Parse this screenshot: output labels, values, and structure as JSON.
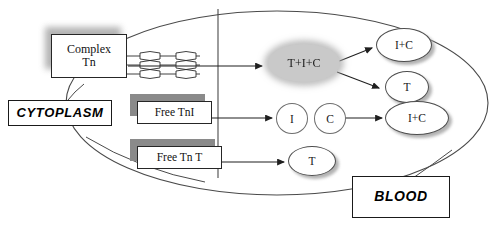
{
  "diagram": {
    "compartments": {
      "cytoplasm": "CYTOPLASM",
      "blood": "BLOOD"
    },
    "cell_boundary": {
      "shape": "ellipse",
      "label": "cell-membrane"
    },
    "membrane_line": {
      "orientation": "vertical",
      "label": "membrane-boundary"
    },
    "cytoplasm_nodes": [
      {
        "id": "complex-tn",
        "label": "Complex\nTn",
        "shape": "rect",
        "shadow": "soft"
      },
      {
        "id": "free-tni",
        "label": "Free TnI",
        "shape": "rect",
        "shadow": "dark"
      },
      {
        "id": "free-tnt",
        "label": "Free Tn T",
        "shape": "rect",
        "shadow": "dark"
      }
    ],
    "myofilament": {
      "id": "myofilament",
      "label": "sarcomere-filament-icon",
      "rows": 3
    },
    "blood_nodes": [
      {
        "id": "t-i-c",
        "label": "T+I+C",
        "shape": "ellipse",
        "fill": "#c9c9c9"
      },
      {
        "id": "i-c-upper",
        "label": "I+C",
        "shape": "ellipse",
        "fill": "#ffffff"
      },
      {
        "id": "t-upper",
        "label": "T",
        "shape": "ellipse",
        "fill": "#ffffff"
      },
      {
        "id": "i-free",
        "label": "I",
        "shape": "ellipse",
        "fill": "#ffffff"
      },
      {
        "id": "c-free",
        "label": "C",
        "shape": "ellipse",
        "fill": "#ffffff"
      },
      {
        "id": "i-c-lower",
        "label": "I+C",
        "shape": "ellipse",
        "fill": "#ffffff"
      },
      {
        "id": "t-lower",
        "label": "T",
        "shape": "ellipse",
        "fill": "#ffffff"
      }
    ],
    "arrows": [
      {
        "id": "arrow-complex-to-tic",
        "from": "complex-tn",
        "to": "t-i-c"
      },
      {
        "id": "arrow-tni-to-i",
        "from": "free-tni",
        "to": "i-free"
      },
      {
        "id": "arrow-tnt-to-t",
        "from": "free-tnt",
        "to": "t-lower"
      },
      {
        "id": "arrow-tic-to-ic",
        "from": "t-i-c",
        "to": "i-c-upper"
      },
      {
        "id": "arrow-tic-to-t",
        "from": "t-i-c",
        "to": "t-upper"
      },
      {
        "id": "arrow-c-to-ic",
        "from": "c-free",
        "to": "i-c-lower"
      }
    ],
    "colors": {
      "stroke": "#262626",
      "fill_gray": "#c9c9c9",
      "shadow_gray": "#8a8a8a",
      "background": "#ffffff"
    }
  }
}
